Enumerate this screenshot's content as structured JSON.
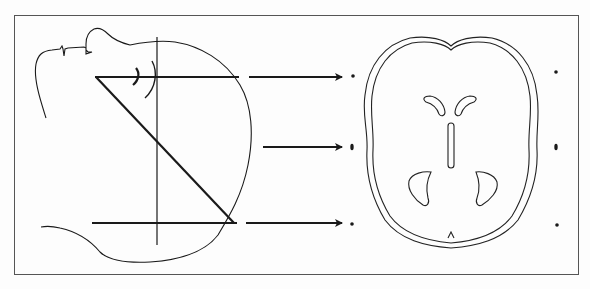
{
  "figure": {
    "description": "Lateral head profile with scan planes mapped by arrows to an axial brain slice",
    "colors": {
      "line": "#1a1a1a",
      "frame": "#555555",
      "background": "#fdfdfd"
    },
    "panels": [
      {
        "name": "lateral-head-profile",
        "elements": [
          "face-profile",
          "skull-outline",
          "vertical-reference-line",
          "upper-scan-plane",
          "lower-scan-plane",
          "diagonal-scan-line",
          "orbit-arcs"
        ]
      },
      {
        "name": "axial-brain-slice",
        "elements": [
          "outer-skull-contour",
          "inner-brain-contour",
          "frontal-horns",
          "third-ventricle",
          "occipital-horns"
        ]
      }
    ],
    "arrows": [
      {
        "level": "upper",
        "marker": "small-dot"
      },
      {
        "level": "middle",
        "marker": "oval-dot"
      },
      {
        "level": "lower",
        "marker": "small-dot"
      }
    ],
    "right_markers": [
      "small-dot",
      "oval-dot",
      "small-dot"
    ]
  }
}
